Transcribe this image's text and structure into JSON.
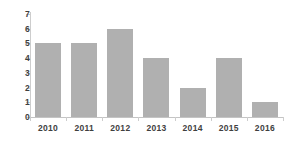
{
  "chart_data": {
    "type": "bar",
    "title": "",
    "subtitle": "",
    "xlabel": "",
    "ylabel": "",
    "categories": [
      "2010",
      "2011",
      "2012",
      "2013",
      "2014",
      "2015",
      "2016"
    ],
    "values": [
      5,
      5,
      6,
      4,
      2,
      4,
      1
    ],
    "ylim": [
      0,
      7
    ],
    "y_ticks": [
      "0",
      "1",
      "2",
      "3",
      "4",
      "5",
      "6",
      "7"
    ],
    "y_tick_values": [
      0,
      1,
      2,
      3,
      4,
      5,
      6,
      7
    ],
    "grid": false,
    "legend": null,
    "legend_position": "none",
    "annotations": [],
    "colors": {
      "bar_fill": "#b0b0b0",
      "axis_line": "#c8c8c8",
      "tick_mark": "#cdcdcd",
      "tick_text": "#3f3f3f",
      "background": "#ffffff"
    }
  }
}
